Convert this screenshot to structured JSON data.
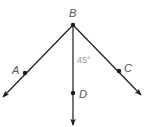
{
  "diagram": {
    "type": "geometry-rays",
    "vertex": {
      "label": "B",
      "x": 73,
      "y": 25
    },
    "rays": [
      {
        "name": "BA",
        "point_label": "A",
        "point": {
          "x": 25,
          "y": 73
        },
        "tip": {
          "x": 3,
          "y": 97
        }
      },
      {
        "name": "BD",
        "point_label": "D",
        "point": {
          "x": 73,
          "y": 93
        },
        "tip": {
          "x": 73,
          "y": 125
        }
      },
      {
        "name": "BC",
        "point_label": "C",
        "point": {
          "x": 119,
          "y": 71
        },
        "tip": {
          "x": 141,
          "y": 95
        }
      }
    ],
    "angle_label": "45°",
    "colors": {
      "line": "#1a1a1a",
      "label": "#555555",
      "angle_label": "#9a9a9a"
    }
  },
  "labels": {
    "B": "B",
    "A": "A",
    "C": "C",
    "D": "D",
    "angle": "45°"
  }
}
